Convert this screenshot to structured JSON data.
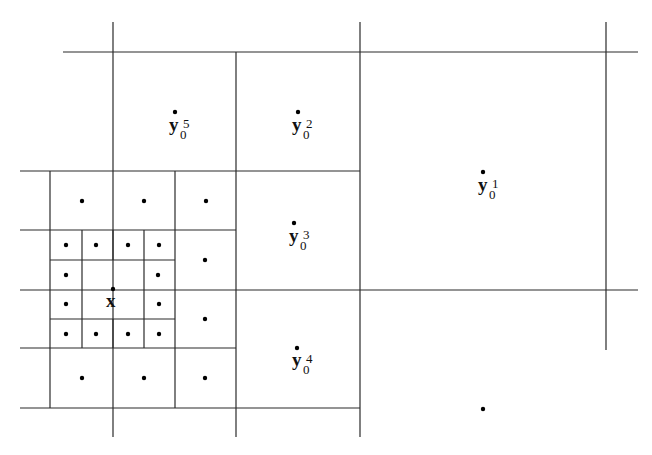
{
  "diagram": {
    "type": "adaptive-quadtree-grid",
    "labels": {
      "x": {
        "base": "x",
        "sub": "",
        "sup": ""
      },
      "y1": {
        "base": "y",
        "sub": "0",
        "sup": "1"
      },
      "y2": {
        "base": "y",
        "sub": "0",
        "sup": "2"
      },
      "y3": {
        "base": "y",
        "sub": "0",
        "sup": "3"
      },
      "y4": {
        "base": "y",
        "sub": "0",
        "sup": "4"
      },
      "y5": {
        "base": "y",
        "sub": "0",
        "sup": "5"
      }
    },
    "colors": {
      "line": "#2a2a2a",
      "dot": "#000000",
      "background": "#ffffff"
    }
  }
}
